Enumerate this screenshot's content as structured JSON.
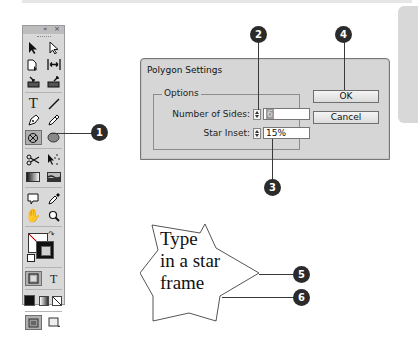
{
  "toolbox": {
    "header_buttons": [
      "«",
      "×"
    ],
    "tools": [
      [
        "selection-tool",
        "direct-selection-tool"
      ],
      [
        "page-tool",
        "gap-tool"
      ],
      [
        "content-collector-tool",
        "content-placer-tool"
      ],
      [
        "type-tool",
        "line-tool"
      ],
      [
        "pen-tool",
        "pencil-tool"
      ],
      [
        "rectangle-frame-tool",
        "polygon-tool"
      ],
      [
        "scissors-tool",
        "free-transform-tool"
      ],
      [
        "gradient-swatch-tool",
        "gradient-feather-tool"
      ],
      [
        "note-tool",
        "eyedropper-tool"
      ],
      [
        "hand-tool",
        "zoom-tool"
      ]
    ],
    "text_tool_glyph": "T",
    "formatting_text_glyph": "T"
  },
  "dialog": {
    "title": "Polygon Settings",
    "group_label": "Options",
    "fields": [
      {
        "label": "Number of Sides:",
        "value": "6"
      },
      {
        "label": "Star Inset:",
        "value": "15%"
      }
    ],
    "ok_label": "OK",
    "cancel_label": "Cancel"
  },
  "star_frame": {
    "lines": [
      "Type",
      "in a star",
      "frame"
    ]
  },
  "callouts": [
    "1",
    "2",
    "3",
    "4",
    "5",
    "6"
  ]
}
